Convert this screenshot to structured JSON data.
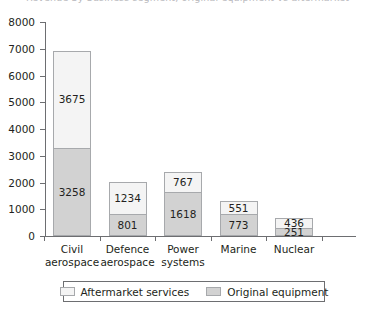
{
  "title_fragment": "Revenue by business segment, original equipment vs aftermarket",
  "chart_data": {
    "type": "bar",
    "subtype": "stacked-vertical",
    "title": "",
    "xlabel": "",
    "ylabel": "",
    "ylim": [
      0,
      8000
    ],
    "ytick_step": 1000,
    "ytick_labels": [
      "0",
      "1000",
      "2000",
      "3000",
      "4000",
      "5000",
      "6000",
      "7000",
      "8000"
    ],
    "ytick_values": [
      0,
      1000,
      2000,
      3000,
      4000,
      5000,
      6000,
      7000,
      8000
    ],
    "grid": false,
    "legend_position": "bottom",
    "categories": [
      "Civil aerospace",
      "Defence aerospace",
      "Power systems",
      "Marine",
      "Nuclear"
    ],
    "category_lines": [
      [
        "Civil",
        "aerospace"
      ],
      [
        "Defence",
        "aerospace"
      ],
      [
        "Power",
        "systems"
      ],
      [
        "Marine",
        ""
      ],
      [
        "Nuclear",
        ""
      ]
    ],
    "series": [
      {
        "name": "Original equipment",
        "color": "#d2d2d2",
        "stack_position": "bottom",
        "values": [
          3258,
          801,
          1618,
          773,
          251
        ]
      },
      {
        "name": "Aftermarket services",
        "color": "#f4f4f4",
        "stack_position": "top",
        "values": [
          3675,
          1234,
          767,
          551,
          436
        ]
      }
    ],
    "totals": [
      6933,
      2035,
      2385,
      1324,
      687
    ]
  },
  "legend": {
    "entries": [
      {
        "label": "Aftermarket services",
        "swatch": "aftermarket"
      },
      {
        "label": "Original equipment",
        "swatch": "original"
      }
    ]
  },
  "colors": {
    "aftermarket": "#f4f4f4",
    "original": "#d2d2d2",
    "bar_border": "#a7a9ac",
    "axis": "#6d6e71",
    "text": "#231f20"
  }
}
